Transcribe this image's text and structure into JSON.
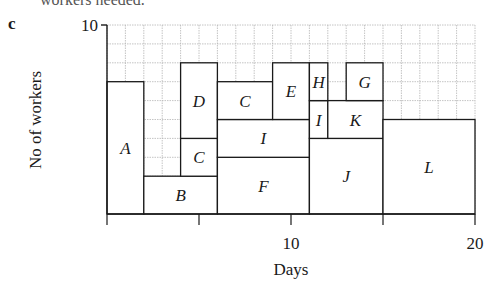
{
  "header": {
    "cut_text": "workers needed.",
    "part_label": "c"
  },
  "chart_data": {
    "type": "gantt-resource-histogram",
    "title": "",
    "xlabel": "Days",
    "ylabel": "No of workers",
    "xlim": [
      0,
      20
    ],
    "ylim": [
      0,
      10
    ],
    "x_ticks": [
      0,
      5,
      10,
      15,
      20
    ],
    "x_tick_labels": [
      "",
      "",
      "10",
      "",
      "20"
    ],
    "y_tick_labels": [
      {
        "value": 10,
        "label": "10"
      }
    ],
    "grid": true,
    "grid_step": 1,
    "blocks": [
      {
        "label": "A",
        "x0": 0,
        "x1": 2,
        "y0": 0,
        "y1": 7
      },
      {
        "label": "B",
        "x0": 2,
        "x1": 6,
        "y0": 0,
        "y1": 2
      },
      {
        "label": "C",
        "x0": 4,
        "x1": 6,
        "y0": 2,
        "y1": 4
      },
      {
        "label": "D",
        "x0": 4,
        "x1": 6,
        "y0": 4,
        "y1": 8
      },
      {
        "label": "F",
        "x0": 6,
        "x1": 11,
        "y0": 0,
        "y1": 3
      },
      {
        "label": "I",
        "x0": 6,
        "x1": 11,
        "y0": 3,
        "y1": 5
      },
      {
        "label": "C",
        "x0": 6,
        "x1": 9,
        "y0": 5,
        "y1": 7
      },
      {
        "label": "E",
        "x0": 9,
        "x1": 11,
        "y0": 5,
        "y1": 8
      },
      {
        "label": "J",
        "x0": 11,
        "x1": 15,
        "y0": 0,
        "y1": 4
      },
      {
        "label": "I",
        "x0": 11,
        "x1": 12,
        "y0": 4,
        "y1": 6
      },
      {
        "label": "K",
        "x0": 12,
        "x1": 15,
        "y0": 4,
        "y1": 6
      },
      {
        "label": "H",
        "x0": 11,
        "x1": 12,
        "y0": 6,
        "y1": 8
      },
      {
        "label": "G",
        "x0": 13,
        "x1": 15,
        "y0": 6,
        "y1": 8
      },
      {
        "label": "L",
        "x0": 15,
        "x1": 20,
        "y0": 0,
        "y1": 5
      }
    ]
  },
  "style": {
    "line_color": "#1a1a1a",
    "grid_color": "#b5b5b5",
    "box_fill": "#ffffff"
  }
}
